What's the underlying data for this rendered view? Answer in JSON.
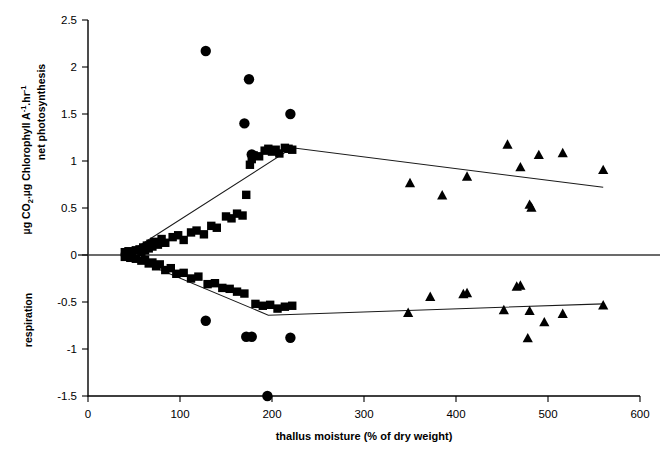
{
  "chart_data": {
    "type": "scatter",
    "title": "",
    "xlabel": "thallus moisture (% of dry weight)",
    "ylabel": "µg CO₂.µg Chlorophyll A⁻¹.hr⁻¹",
    "ylabel_upper_region": "net photosynthesis",
    "ylabel_lower_region": "respiration",
    "xlim": [
      0,
      600
    ],
    "ylim": [
      -1.5,
      2.5
    ],
    "xticks": [
      0,
      100,
      200,
      300,
      400,
      500,
      600
    ],
    "xtick_labels": [
      "0",
      "100",
      "200",
      "300",
      "400",
      "500",
      "600"
    ],
    "yticks": [
      -1.5,
      -1,
      -0.5,
      0,
      0.5,
      1,
      1.5,
      2,
      2.5
    ],
    "ytick_labels": [
      "-1.5",
      "-1",
      "-0.5",
      "0",
      "0.5",
      "1",
      "1.5",
      "2",
      "2.5"
    ],
    "grid": false,
    "legend": "none",
    "zero_reference_line": 0,
    "series": [
      {
        "name": "net photosynthesis - squares (low moisture)",
        "marker": "square",
        "color": "#000000",
        "points": [
          [
            40,
            0.03
          ],
          [
            44,
            0.04
          ],
          [
            48,
            0.02
          ],
          [
            52,
            0.05
          ],
          [
            56,
            0.06
          ],
          [
            58,
            0.03
          ],
          [
            60,
            0.08
          ],
          [
            62,
            0.05
          ],
          [
            64,
            0.1
          ],
          [
            66,
            0.07
          ],
          [
            68,
            0.12
          ],
          [
            70,
            0.09
          ],
          [
            72,
            0.14
          ],
          [
            76,
            0.11
          ],
          [
            80,
            0.17
          ],
          [
            84,
            0.13
          ],
          [
            92,
            0.19
          ],
          [
            98,
            0.21
          ],
          [
            104,
            0.16
          ],
          [
            112,
            0.24
          ],
          [
            118,
            0.26
          ],
          [
            126,
            0.22
          ],
          [
            134,
            0.31
          ],
          [
            140,
            0.29
          ],
          [
            150,
            0.41
          ],
          [
            156,
            0.39
          ],
          [
            162,
            0.44
          ],
          [
            168,
            0.42
          ],
          [
            172,
            0.64
          ],
          [
            176,
            0.96
          ],
          [
            178,
            1.02
          ],
          [
            180,
            1.06
          ],
          [
            186,
            1.05
          ],
          [
            192,
            1.11
          ],
          [
            196,
            1.13
          ],
          [
            200,
            1.1
          ],
          [
            204,
            1.12
          ],
          [
            208,
            1.08
          ],
          [
            214,
            1.14
          ],
          [
            218,
            1.13
          ],
          [
            222,
            1.12
          ]
        ]
      },
      {
        "name": "net photosynthesis - circles (outliers)",
        "marker": "circle",
        "color": "#000000",
        "points": [
          [
            128,
            2.17
          ],
          [
            175,
            1.87
          ],
          [
            170,
            1.4
          ],
          [
            220,
            1.5
          ],
          [
            178,
            1.07
          ]
        ]
      },
      {
        "name": "net photosynthesis - triangles (high moisture)",
        "marker": "triangle",
        "color": "#000000",
        "points": [
          [
            350,
            0.76
          ],
          [
            385,
            0.63
          ],
          [
            412,
            0.83
          ],
          [
            456,
            1.17
          ],
          [
            470,
            0.93
          ],
          [
            480,
            0.53
          ],
          [
            482,
            0.5
          ],
          [
            490,
            1.06
          ],
          [
            516,
            1.08
          ],
          [
            560,
            0.9
          ]
        ]
      },
      {
        "name": "respiration - squares (low moisture)",
        "marker": "square",
        "color": "#000000",
        "points": [
          [
            40,
            -0.02
          ],
          [
            46,
            -0.03
          ],
          [
            52,
            -0.04
          ],
          [
            58,
            -0.06
          ],
          [
            62,
            -0.05
          ],
          [
            66,
            -0.09
          ],
          [
            70,
            -0.08
          ],
          [
            74,
            -0.12
          ],
          [
            78,
            -0.1
          ],
          [
            84,
            -0.16
          ],
          [
            90,
            -0.14
          ],
          [
            96,
            -0.2
          ],
          [
            104,
            -0.19
          ],
          [
            112,
            -0.25
          ],
          [
            120,
            -0.23
          ],
          [
            130,
            -0.31
          ],
          [
            138,
            -0.3
          ],
          [
            146,
            -0.35
          ],
          [
            154,
            -0.36
          ],
          [
            162,
            -0.39
          ],
          [
            170,
            -0.41
          ],
          [
            182,
            -0.52
          ],
          [
            190,
            -0.54
          ],
          [
            198,
            -0.53
          ],
          [
            206,
            -0.57
          ],
          [
            214,
            -0.55
          ],
          [
            222,
            -0.54
          ]
        ]
      },
      {
        "name": "respiration - circles (outliers)",
        "marker": "circle",
        "color": "#000000",
        "points": [
          [
            128,
            -0.7
          ],
          [
            172,
            -0.87
          ],
          [
            178,
            -0.87
          ],
          [
            220,
            -0.88
          ],
          [
            195,
            -1.5
          ]
        ]
      },
      {
        "name": "respiration - triangles (high moisture)",
        "marker": "triangle",
        "color": "#000000",
        "points": [
          [
            408,
            -0.42
          ],
          [
            412,
            -0.41
          ],
          [
            452,
            -0.59
          ],
          [
            466,
            -0.34
          ],
          [
            470,
            -0.33
          ],
          [
            478,
            -0.89
          ],
          [
            480,
            -0.6
          ],
          [
            496,
            -0.72
          ],
          [
            516,
            -0.63
          ],
          [
            560,
            -0.54
          ],
          [
            348,
            -0.62
          ],
          [
            372,
            -0.45
          ]
        ]
      }
    ],
    "trendlines": [
      {
        "name": "net photosynthesis trend",
        "vertices": [
          [
            40,
            0.0
          ],
          [
            222,
            1.14
          ],
          [
            560,
            0.72
          ]
        ]
      },
      {
        "name": "respiration trend",
        "vertices": [
          [
            40,
            0.0
          ],
          [
            196,
            -0.64
          ],
          [
            560,
            -0.52
          ]
        ]
      }
    ]
  }
}
